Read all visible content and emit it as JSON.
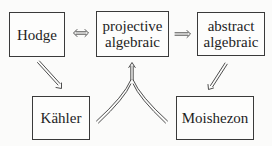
{
  "diagram": {
    "type": "implication-diagram",
    "nodes": [
      {
        "id": "hodge",
        "lines": [
          "Hodge"
        ]
      },
      {
        "id": "projective",
        "lines": [
          "projective",
          "algebraic"
        ]
      },
      {
        "id": "abstract",
        "lines": [
          "abstract",
          "algebraic"
        ]
      },
      {
        "id": "kahler",
        "lines": [
          "Kähler"
        ]
      },
      {
        "id": "moishezon",
        "lines": [
          "Moishezon"
        ]
      }
    ],
    "edges": [
      {
        "from": "hodge",
        "to": "projective",
        "style": "double-headed-double-arrow",
        "symbol": "⟺"
      },
      {
        "from": "projective",
        "to": "abstract",
        "style": "double-arrow",
        "symbol": "⟹"
      },
      {
        "from": "hodge",
        "to": "kahler",
        "style": "double-arrow",
        "symbol": "⟹"
      },
      {
        "from": "abstract",
        "to": "moishezon",
        "style": "double-arrow",
        "symbol": "⟹"
      },
      {
        "from": [
          "kahler",
          "moishezon"
        ],
        "to": "projective",
        "style": "merging-double-arrow",
        "symbol": "⟹"
      }
    ],
    "colors": {
      "ink": "#3a3a3a",
      "text": "#1e1e1e",
      "background": "#fbfbfa"
    }
  }
}
